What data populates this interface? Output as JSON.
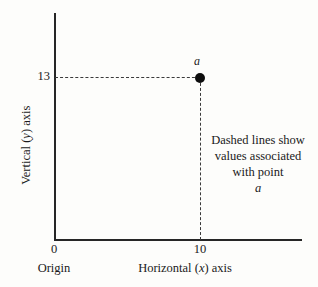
{
  "chart_data": {
    "type": "scatter",
    "title": "",
    "xlabel": "Horizontal (x) axis",
    "ylabel": "Vertical (y) axis",
    "xlim": [
      0,
      14
    ],
    "ylim": [
      0,
      18
    ],
    "grid": false,
    "legend": "none",
    "x_tick_labels": [
      "0",
      "10"
    ],
    "y_tick_labels": [
      "13"
    ],
    "x_ticks": [
      0,
      10
    ],
    "y_ticks": [
      13
    ],
    "points": [
      {
        "label": "a",
        "x": 10,
        "y": 13
      }
    ],
    "series": [
      {
        "name": "point a",
        "x": [
          10
        ],
        "y": [
          13
        ]
      }
    ],
    "annotations": [
      {
        "name": "dashed-line-note",
        "lines": [
          "Dashed lines show",
          "values associated",
          "with point a"
        ]
      }
    ],
    "guide_lines": [
      {
        "orientation": "horizontal",
        "style": "dashed",
        "from": [
          0,
          13
        ],
        "to": [
          10,
          13
        ]
      },
      {
        "orientation": "vertical",
        "style": "dashed",
        "from": [
          10,
          0
        ],
        "to": [
          10,
          13
        ]
      }
    ]
  },
  "axes": {
    "y_title_prefix": "Vertical (",
    "y_title_var": "y",
    "y_title_suffix": ") axis",
    "x_title_prefix": "Horizontal (",
    "x_title_var": "x",
    "x_title_suffix": ") axis",
    "origin_label": "Origin",
    "y_tick_13": "13",
    "x_tick_0": "0",
    "x_tick_10": "10"
  },
  "point": {
    "label": "a"
  },
  "annotation": {
    "line1": "Dashed lines show",
    "line2": "values associated",
    "line3_prefix": "with point ",
    "line3_var": "a"
  },
  "colors": {
    "background": "#fdfdfb",
    "axis": "#262626",
    "dash": "#3a3a3a",
    "point": "#0d0d0d",
    "text": "#1a1a1a"
  }
}
